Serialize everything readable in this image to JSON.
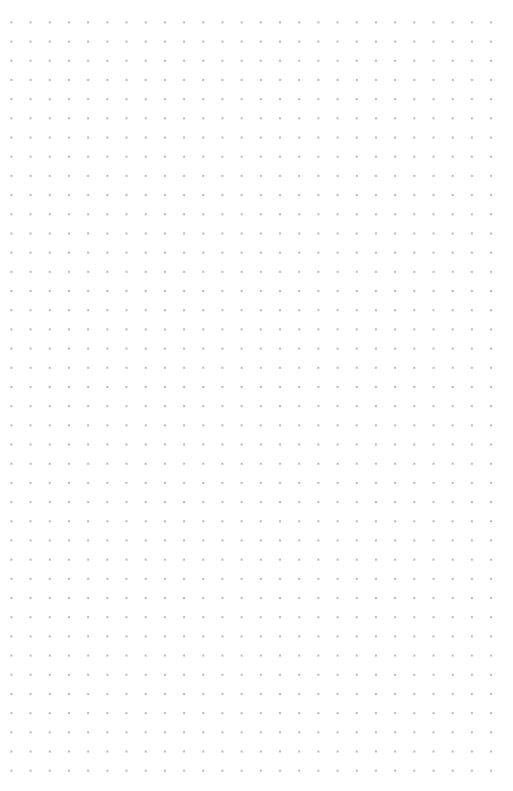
{
  "page": {
    "kind": "blank-dot-grid-canvas",
    "width": 513,
    "height": 791,
    "background_color": "#ffffff",
    "content_text": "",
    "notes": ""
  },
  "grid": {
    "dot_color": "#a8a8b2",
    "dot_diameter_px": 1.6,
    "spacing_x_px": 19.2,
    "spacing_y_px": 19.2,
    "origin_x_px": 11,
    "origin_y_px": 22,
    "columns": 26,
    "rows": 39,
    "margin_left_px": 11,
    "margin_top_px": 22,
    "margin_right_px": 22,
    "margin_bottom_px": 21
  }
}
